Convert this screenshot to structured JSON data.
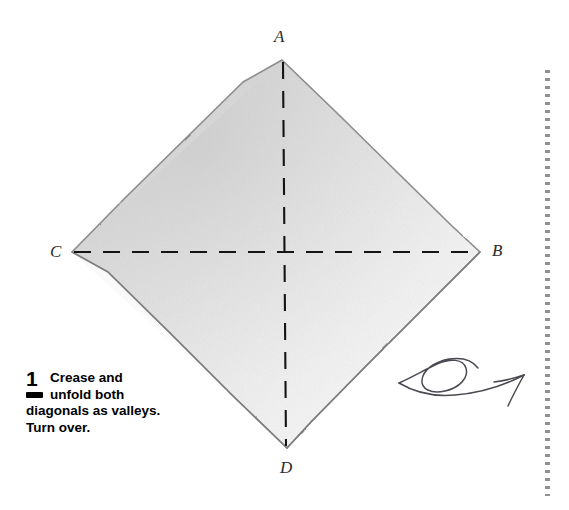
{
  "figure": {
    "type": "origami-diagram",
    "shape_name": "square-sheet-diamond-orientation",
    "paper_color_light": "#fbfbfb",
    "paper_color_mid": "#e2e2e2",
    "paper_color_dark": "#cfcfcf",
    "edge_color": "#8b8b8b",
    "crease_color": "#111111",
    "vertices": {
      "A": {
        "label": "A",
        "x": 282,
        "y": 60,
        "position": "top"
      },
      "B": {
        "label": "B",
        "x": 480,
        "y": 252,
        "position": "right"
      },
      "C": {
        "label": "C",
        "x": 72,
        "y": 252,
        "position": "left"
      },
      "D": {
        "label": "D",
        "x": 287,
        "y": 448,
        "position": "bottom"
      }
    },
    "creases": [
      {
        "name": "vertical-diagonal-crease",
        "from": "A",
        "to": "D",
        "fold_type": "valley",
        "style": "dashed"
      },
      {
        "name": "horizontal-diagonal-crease",
        "from": "C",
        "to": "B",
        "fold_type": "valley",
        "style": "dashed"
      }
    ],
    "crease_intersection": {
      "x": 285,
      "y": 252
    }
  },
  "caption": {
    "step_number": "1",
    "legend_symbol_name": "valley-fold-dash",
    "line_1": "Crease and",
    "line_2": "unfold both",
    "line_3": "diagonals as valleys.",
    "line_4": "Turn over."
  },
  "annotations": {
    "turn_over_arrow": {
      "name": "turn-over-arrow",
      "style": "hand-drawn-looping-arrow",
      "color": "#4a4a52",
      "direction": "points-up-right"
    },
    "right_dotted_rule": {
      "name": "page-divider-dotted-rule",
      "color": "#8f8f95",
      "orientation": "vertical"
    }
  }
}
